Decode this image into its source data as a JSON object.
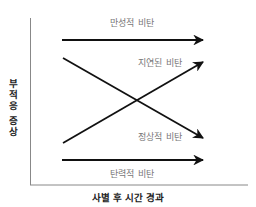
{
  "diagram": {
    "x_axis_label": "사별 후 시간 경과",
    "y_axis_label": "부적응 증상",
    "series": [
      {
        "name": "만성적 비탄",
        "label": "만성적 비탄",
        "trend": "constant-high",
        "start": [
          62,
          40
        ],
        "end": [
          203,
          40
        ]
      },
      {
        "name": "지연된 비탄",
        "label": "지연된 비탄",
        "trend": "low-to-high",
        "start": [
          63,
          143
        ],
        "end": [
          203,
          62
        ]
      },
      {
        "name": "정상적 비탄",
        "label": "정상적 비탄",
        "trend": "high-to-low",
        "start": [
          63,
          58
        ],
        "end": [
          203,
          138
        ]
      },
      {
        "name": "탄력적 비탄",
        "label": "탄력적 비탄",
        "trend": "constant-low",
        "start": [
          62,
          160
        ],
        "end": [
          203,
          160
        ]
      }
    ],
    "colors": {
      "lines": "#111111",
      "axes": "#888888",
      "series_labels": "#777777",
      "axis_labels": "#222222"
    }
  }
}
